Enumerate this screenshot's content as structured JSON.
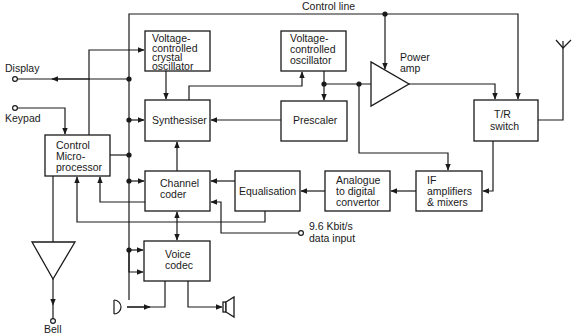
{
  "diagram": {
    "colors": {
      "line": "#1a1a1a",
      "background": "#ffffff"
    },
    "labels": {
      "control_line": "Control line",
      "display": "Display",
      "keypad": "Keypad",
      "bell": "Bell",
      "power_amp": [
        "Power",
        "amp"
      ],
      "data_input": [
        "9.6 Kbit/s",
        "data input"
      ]
    },
    "blocks": {
      "vcxo": [
        "Voltage-",
        "controlled",
        "crystal",
        "oscillator"
      ],
      "vco": [
        "Voltage-",
        "controlled",
        "oscillator"
      ],
      "synthesiser": [
        "Synthesiser"
      ],
      "prescaler": [
        "Prescaler"
      ],
      "control_micro": [
        "Control",
        "Micro-",
        "processor"
      ],
      "tr_switch": [
        "T/R",
        "switch"
      ],
      "channel_coder": [
        "Channel",
        "coder"
      ],
      "equalisation": [
        "Equalisation"
      ],
      "adc": [
        "Analogue",
        "to digital",
        "convertor"
      ],
      "if_amps": [
        "IF",
        "amplifiers",
        "& mixers"
      ],
      "voice_codec": [
        "Voice",
        "codec"
      ]
    },
    "icons": {
      "antenna": "antenna-icon",
      "microphone": "microphone-icon",
      "speaker": "speaker-icon",
      "bell_amplifier": "triangle-amplifier-icon",
      "power_amplifier": "triangle-amplifier-icon"
    }
  }
}
